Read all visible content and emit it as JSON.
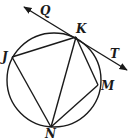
{
  "diagram": {
    "type": "circle with inscribed quadrilateral and tangent line",
    "stroke_color": "#1a1a1a",
    "circle": {
      "cx": 54,
      "cy": 80,
      "r": 47
    },
    "points": {
      "K": {
        "label": "K",
        "x": 76,
        "y": 37,
        "label_x": 76,
        "label_y": 32
      },
      "J": {
        "label": "J",
        "x": 12,
        "y": 57,
        "label_x": 2,
        "label_y": 60
      },
      "M": {
        "label": "M",
        "x": 98,
        "y": 85,
        "label_x": 101,
        "label_y": 90
      },
      "N": {
        "label": "N",
        "x": 51,
        "y": 127,
        "label_x": 45,
        "label_y": 139
      },
      "Q": {
        "label": "Q",
        "label_x": 40,
        "label_y": 15
      },
      "T": {
        "label": "T",
        "label_x": 110,
        "label_y": 58
      }
    },
    "tangent_line": {
      "from": "Q",
      "to": "T",
      "x1": 24,
      "y1": 7,
      "x2": 127,
      "y2": 70,
      "through": "K"
    },
    "segments": [
      "JK",
      "KM",
      "MN",
      "NJ",
      "KN"
    ]
  }
}
